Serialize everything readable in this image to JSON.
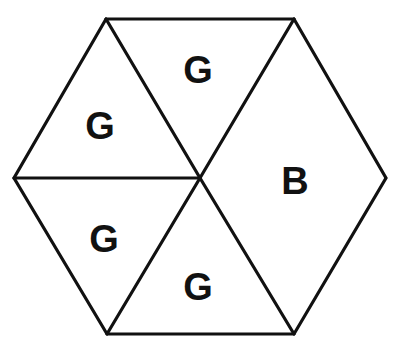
{
  "diagram": {
    "type": "hexagon-partition",
    "line_color": "#111111",
    "background": "#ffffff",
    "vertices": {
      "top_left": [
        106,
        19
      ],
      "top_right": [
        294,
        19
      ],
      "left": [
        14,
        178
      ],
      "center": [
        200,
        178
      ],
      "right": [
        386,
        178
      ],
      "bottom_left": [
        107,
        334
      ],
      "bottom_right": [
        294,
        334
      ]
    },
    "regions": [
      {
        "id": "top-triangle",
        "shape": "triangle",
        "label": "G",
        "label_pos": [
          198,
          83
        ]
      },
      {
        "id": "upper-left-triangle",
        "shape": "triangle",
        "label": "G",
        "label_pos": [
          100,
          139
        ]
      },
      {
        "id": "lower-left-triangle",
        "shape": "triangle",
        "label": "G",
        "label_pos": [
          104,
          252
        ]
      },
      {
        "id": "bottom-triangle",
        "shape": "triangle",
        "label": "G",
        "label_pos": [
          198,
          300
        ]
      },
      {
        "id": "right-rhombus",
        "shape": "rhombus",
        "label": "B",
        "label_pos": [
          295,
          194
        ]
      }
    ]
  }
}
